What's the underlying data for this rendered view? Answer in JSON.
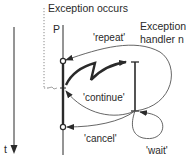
{
  "diagram": {
    "title_event": "Exception occurs",
    "process_label": "P",
    "handler_label_line1": "Exception",
    "handler_label_line2": "handler n",
    "time_label": "t",
    "arrows": {
      "repeat": "'repeat'",
      "continue": "'continue'",
      "cancel": "'cancel'",
      "wait": "'wait'"
    },
    "colors": {
      "line": "#2a2a2a",
      "thin_curve": "#555555",
      "dotted": "#8a8a8a",
      "background": "#ffffff"
    }
  }
}
